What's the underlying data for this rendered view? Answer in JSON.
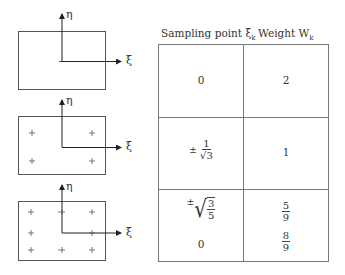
{
  "diagrams": {
    "axis_labels": {
      "eta": "η",
      "xi": "ξ"
    },
    "marker": "+",
    "panels": [
      {
        "name": "one-point",
        "points": 1
      },
      {
        "name": "two-point",
        "points": 4
      },
      {
        "name": "three-point",
        "points": 9
      }
    ]
  },
  "table": {
    "headers": {
      "sampling_point": "Sampling point ξ",
      "sampling_sub": "k",
      "weight": "Weight W",
      "weight_sub": "k"
    },
    "rows": [
      {
        "point": "0",
        "weight": "2"
      },
      {
        "point_pm": "±",
        "point_num": "1",
        "point_den_rad": "3",
        "weight": "1"
      },
      {
        "point_pm": "±",
        "point_rad_num": "3",
        "point_rad_den": "5",
        "point_zero": "0",
        "weight_a_num": "5",
        "weight_a_den": "9",
        "weight_b_num": "8",
        "weight_b_den": "9"
      }
    ]
  }
}
